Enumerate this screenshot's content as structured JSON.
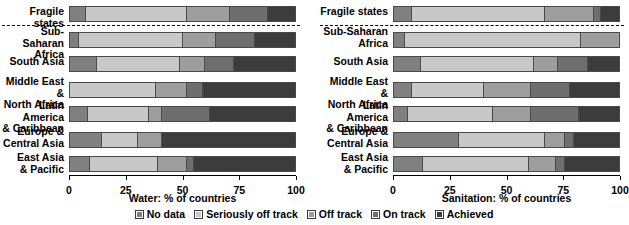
{
  "chart_data": [
    {
      "type": "bar",
      "orientation": "horizontal",
      "stacked": true,
      "title": "",
      "xlabel": "Water: % of countries",
      "ylabel": "",
      "xlim": [
        0,
        100
      ],
      "xticks": [
        0,
        25,
        50,
        75,
        100
      ],
      "xticklabels": [
        "0",
        "25",
        "50",
        "75",
        "100"
      ],
      "grid": false,
      "legend_position": "bottom-center-shared",
      "categories": [
        "Fragile states",
        "Sub-Saharan Africa",
        "South Asia",
        "Middle East & North Africa",
        "Latin America & Caribbean",
        "Europe & Central Asia",
        "East Asia & Pacific"
      ],
      "series": [
        {
          "name": "No data",
          "values": [
            7,
            4,
            12,
            0,
            8,
            14,
            9
          ]
        },
        {
          "name": "Seriously off track",
          "values": [
            45,
            46,
            37,
            38,
            27,
            16,
            30
          ]
        },
        {
          "name": "Off track",
          "values": [
            19,
            15,
            11,
            14,
            6,
            11,
            13
          ]
        },
        {
          "name": "On track",
          "values": [
            17,
            17,
            13,
            7,
            21,
            0,
            3
          ]
        },
        {
          "name": "Achieved",
          "values": [
            12,
            18,
            27,
            41,
            38,
            59,
            45
          ]
        }
      ]
    },
    {
      "type": "bar",
      "orientation": "horizontal",
      "stacked": true,
      "title": "",
      "xlabel": "Sanitation: % of countries",
      "ylabel": "",
      "xlim": [
        0,
        100
      ],
      "xticks": [
        0,
        25,
        50,
        75,
        100
      ],
      "xticklabels": [
        "0",
        "25",
        "50",
        "75",
        "100"
      ],
      "grid": false,
      "legend_position": "bottom-center-shared",
      "categories": [
        "Fragile states",
        "Sub-Saharan Africa",
        "South Asia",
        "Middle East & North Africa",
        "Latin America & Caribbean",
        "Europe & Central Asia",
        "East Asia & Pacific"
      ],
      "series": [
        {
          "name": "No data",
          "values": [
            8,
            5,
            12,
            8,
            6,
            29,
            13
          ]
        },
        {
          "name": "Seriously off track",
          "values": [
            59,
            78,
            50,
            32,
            38,
            38,
            47
          ]
        },
        {
          "name": "Off track",
          "values": [
            22,
            17,
            11,
            21,
            17,
            9,
            12
          ]
        },
        {
          "name": "On track",
          "values": [
            3,
            0,
            13,
            17,
            21,
            4,
            4
          ]
        },
        {
          "name": "Achieved",
          "values": [
            8,
            0,
            14,
            22,
            18,
            20,
            24
          ]
        }
      ]
    }
  ],
  "series_colors": {
    "No data": "#808080",
    "Seriously off track": "#c8c8c8",
    "Off track": "#9e9e9e",
    "On track": "#6e6e6e",
    "Achieved": "#3c3c3c"
  },
  "panels": {
    "left": {
      "axis_title": "Water: % of countries",
      "rows": [
        {
          "label": "Fragile states"
        },
        {
          "label": "Sub-Saharan\nAfrica"
        },
        {
          "label": "South Asia"
        },
        {
          "label": "Middle East &\nNorth Africa"
        },
        {
          "label": "Latin America\n& Caribbean"
        },
        {
          "label": "Europe &\nCentral Asia"
        },
        {
          "label": "East Asia\n& Pacific"
        }
      ],
      "ticks": [
        "0",
        "25",
        "50",
        "75",
        "100"
      ]
    },
    "right": {
      "axis_title": "Sanitation: % of countries",
      "rows": [
        {
          "label": "Fragile states"
        },
        {
          "label": "Sub-Saharan\nAfrica"
        },
        {
          "label": "South Asia"
        },
        {
          "label": "Middle East &\nNorth Africa"
        },
        {
          "label": "Latin America\n& Caribbean"
        },
        {
          "label": "Europe &\nCentral Asia"
        },
        {
          "label": "East Asia\n& Pacific"
        }
      ],
      "ticks": [
        "0",
        "25",
        "50",
        "75",
        "100"
      ]
    }
  },
  "legend": {
    "items": [
      {
        "label": "No data"
      },
      {
        "label": "Seriously off track"
      },
      {
        "label": "Off track"
      },
      {
        "label": "On track"
      },
      {
        "label": "Achieved"
      }
    ]
  }
}
